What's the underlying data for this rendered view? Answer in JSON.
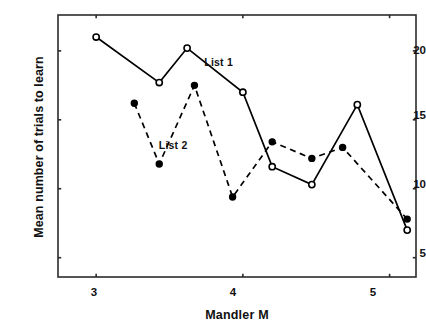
{
  "chart_data": {
    "type": "line",
    "title": "",
    "xlabel": "Mandler M",
    "ylabel": "Mean number of trials to learn",
    "xlim": [
      2.74,
      5.18
    ],
    "ylim": [
      3.6,
      22.6
    ],
    "xticks": [
      3,
      4,
      5
    ],
    "xtick_labels": [
      "3",
      "4",
      "5"
    ],
    "yticks": [
      5,
      10,
      15,
      20
    ],
    "ytick_labels": [
      "5",
      "10",
      "15",
      "20"
    ],
    "grid": false,
    "legend_position": "inline-annotations",
    "series": [
      {
        "name": "List 1",
        "marker": "open-circle",
        "linestyle": "solid",
        "color": "#000000",
        "x": [
          3.0,
          3.43,
          3.62,
          4.0,
          4.2,
          4.47,
          4.78,
          5.12
        ],
        "y": [
          21.0,
          17.7,
          20.2,
          17.0,
          11.6,
          10.3,
          16.1,
          7.0
        ]
      },
      {
        "name": "List 2",
        "marker": "filled-circle",
        "linestyle": "dashed",
        "color": "#000000",
        "x": [
          3.26,
          3.43,
          3.67,
          3.93,
          4.2,
          4.47,
          4.68,
          5.12
        ],
        "y": [
          16.2,
          11.8,
          17.5,
          9.4,
          13.4,
          12.2,
          13.0,
          7.8
        ]
      }
    ],
    "annotations": [
      {
        "text": "List 1",
        "x": 3.86,
        "y": 19.1
      },
      {
        "text": "List 2",
        "x": 3.55,
        "y": 13.1
      }
    ]
  },
  "axis": {
    "xlabel": "Mandler M",
    "ylabel": "Mean number of trials to learn"
  },
  "colors": {
    "ink": "#111111",
    "frame": "#2b2b2b",
    "background": "#ffffff"
  }
}
